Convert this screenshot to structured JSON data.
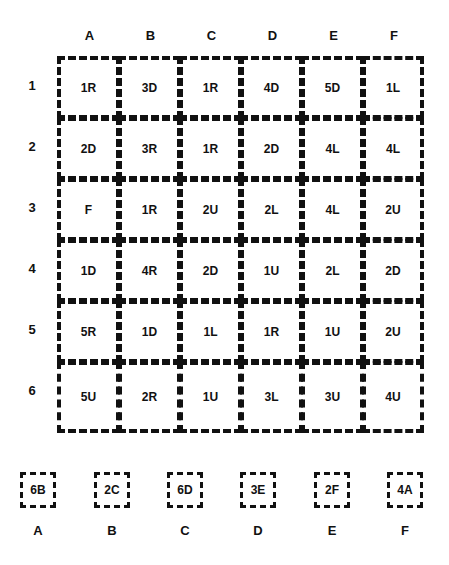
{
  "columns": [
    "A",
    "B",
    "C",
    "D",
    "E",
    "F"
  ],
  "rows": [
    "1",
    "2",
    "3",
    "4",
    "5",
    "6"
  ],
  "grid": [
    [
      "1R",
      "3D",
      "1R",
      "4D",
      "5D",
      "1L"
    ],
    [
      "2D",
      "3R",
      "1R",
      "2D",
      "4L",
      "4L"
    ],
    [
      "F",
      "1R",
      "2U",
      "2L",
      "4L",
      "2U"
    ],
    [
      "1D",
      "4R",
      "2D",
      "1U",
      "2L",
      "2D"
    ],
    [
      "5R",
      "1D",
      "1L",
      "1R",
      "1U",
      "2U"
    ],
    [
      "5U",
      "2R",
      "1U",
      "3L",
      "3U",
      "4U"
    ]
  ],
  "answers": {
    "boxes": [
      "6B",
      "2C",
      "6D",
      "3E",
      "2F",
      "4A"
    ],
    "labels": [
      "A",
      "B",
      "C",
      "D",
      "E",
      "F"
    ]
  }
}
